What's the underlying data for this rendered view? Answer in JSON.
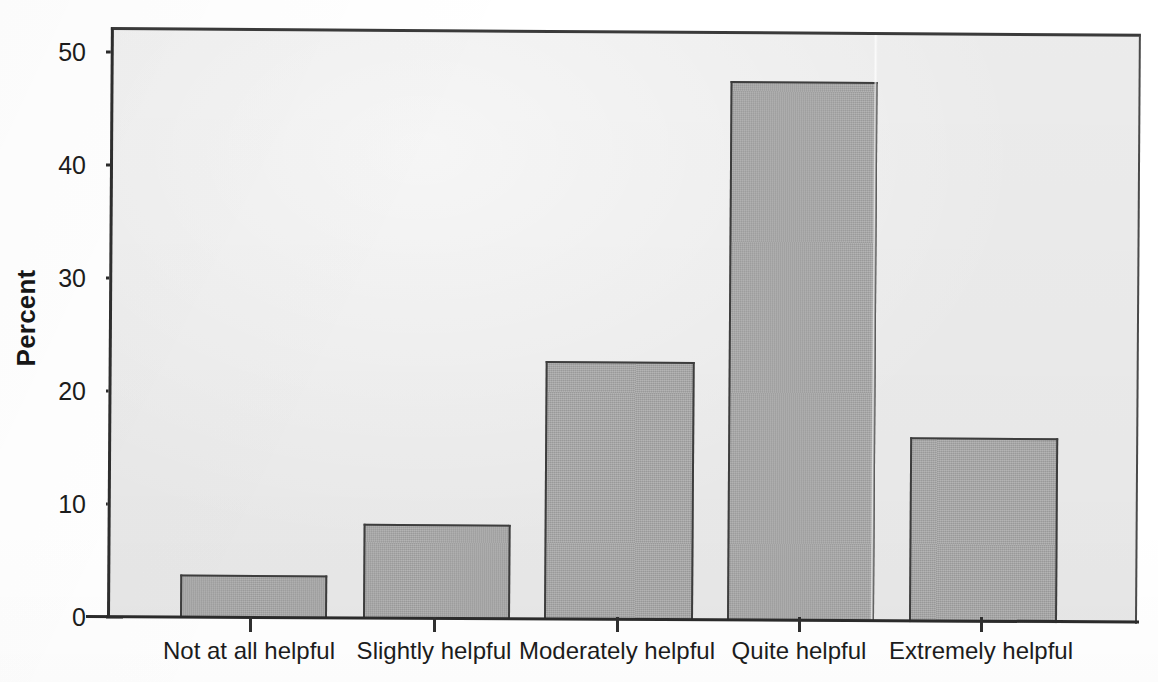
{
  "chart_data": {
    "type": "bar",
    "title": "",
    "xlabel": "",
    "ylabel": "Percent",
    "categories": [
      "Not at all helpful",
      "Slightly helpful",
      "Moderately helpful",
      "Quite helpful",
      "Extremely helpful"
    ],
    "values": [
      3.8,
      8.4,
      22.8,
      47.6,
      16.3
    ],
    "ylim": [
      0,
      52
    ],
    "yticks": [
      0,
      10,
      20,
      30,
      40,
      50
    ],
    "ytick_labels": [
      "0",
      "10",
      "20",
      "30",
      "40",
      "50"
    ],
    "grid": false,
    "legend": null,
    "bar_color": "#a6a6a6",
    "bar_edge_color": "#3d3d3d",
    "plot_background": "#eeeeee",
    "axis_color": "#2b2b2b",
    "text_color": "#1c1c1c"
  }
}
